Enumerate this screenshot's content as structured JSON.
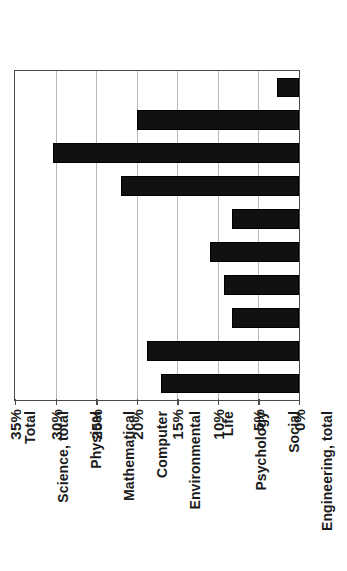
{
  "chart_data": {
    "type": "bar",
    "title": "",
    "subtitle": "",
    "xlabel": "",
    "ylabel": "",
    "orientation": "vertical-bars-rotated-90ccw",
    "grid": true,
    "legend": null,
    "categories": [
      "Total",
      "Science, total",
      "Physical",
      "Mathematical",
      "Computer",
      "Environmental",
      "Life",
      "Psychology",
      "Social",
      "Engineering, total"
    ],
    "values": [
      17.0,
      18.7,
      8.3,
      9.3,
      11.0,
      8.2,
      22.0,
      30.3,
      20.0,
      2.7
    ],
    "value_suffix": "%",
    "ylim": [
      0,
      35
    ],
    "ytick_values": [
      0,
      5,
      10,
      15,
      20,
      25,
      30,
      35
    ],
    "ytick_labels": [
      "0%",
      "5%",
      "10%",
      "15%",
      "20%",
      "25%",
      "30%",
      "35%"
    ],
    "colors": {
      "bar_fill": "#111111",
      "bar_stroke": "#000000",
      "gridline": "#b9b9b9",
      "axis": "#4a4a4a",
      "text": "#1b1b1b",
      "background": "#ffffff"
    }
  }
}
